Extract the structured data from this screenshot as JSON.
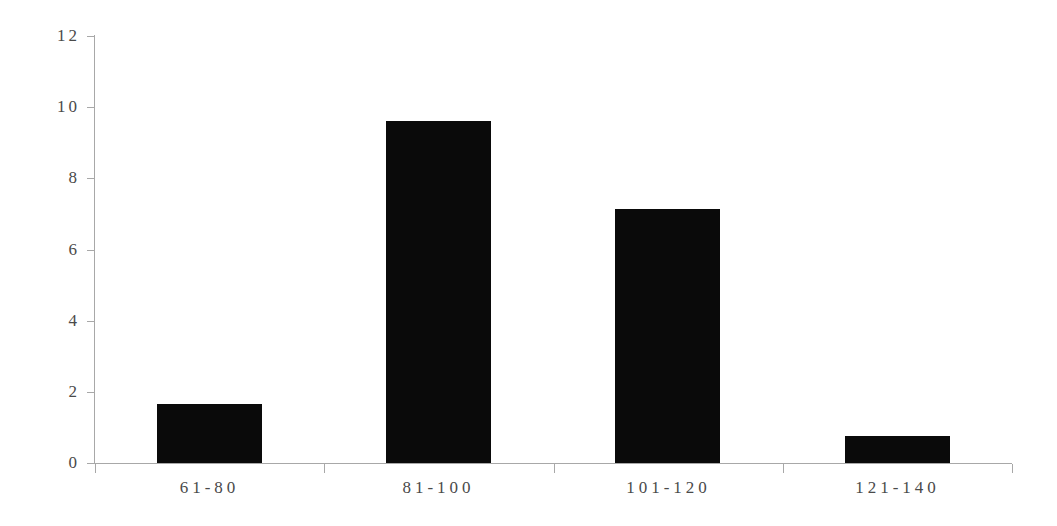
{
  "chart_data": {
    "type": "bar",
    "title": "",
    "subtitle": "",
    "xlabel": "",
    "ylabel": "",
    "categories": [
      "61-80",
      "81-100",
      "101-120",
      "121-140"
    ],
    "values": [
      1.65,
      9.6,
      7.15,
      0.75
    ],
    "ylim": [
      0,
      12
    ],
    "yticks": [
      "0",
      "2",
      "4",
      "6",
      "8",
      "10",
      "12"
    ],
    "ytick_values": [
      0,
      2,
      4,
      6,
      8,
      10,
      12
    ],
    "grid": false,
    "legend": null,
    "series": [
      {
        "name": "",
        "values": [
          1.65,
          9.6,
          7.15,
          0.75
        ]
      }
    ],
    "annotations": []
  },
  "style": {
    "bar_color": "#0a0a0a",
    "axis_color": "#a8a8a8",
    "tick_label_color": "#4a4a4a",
    "background_color": "#ffffff"
  }
}
